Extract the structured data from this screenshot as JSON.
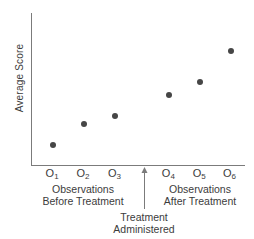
{
  "figure": {
    "y_axis_label": "Average Score",
    "annotations": {
      "before": [
        "Observations",
        "Before Treatment"
      ],
      "after": [
        "Observations",
        "After Treatment"
      ],
      "treatment": [
        "Treatment",
        "Administered"
      ]
    }
  },
  "colors": {
    "axis": "#7b7b7b",
    "dot": "#464646",
    "text": "#3c3c3c",
    "background": "#ffffff"
  },
  "chart_data": {
    "type": "scatter",
    "title": "",
    "xlabel": "",
    "ylabel": "Average Score",
    "categories": [
      "O1",
      "O2",
      "O3",
      "O4",
      "O5",
      "O6"
    ],
    "values": [
      20,
      41,
      49,
      70,
      83,
      114
    ],
    "ylim": [
      0,
      152
    ],
    "grid": false,
    "y_axis_numeric_labels": false,
    "points": [
      {
        "label": "O1",
        "x_frac": 0.099,
        "value": 20
      },
      {
        "label": "O2",
        "x_frac": 0.244,
        "value": 41
      },
      {
        "label": "O3",
        "x_frac": 0.392,
        "value": 49
      },
      {
        "label": "O4",
        "x_frac": 0.645,
        "value": 70
      },
      {
        "label": "O5",
        "x_frac": 0.79,
        "value": 83
      },
      {
        "label": "O6",
        "x_frac": 0.932,
        "value": 114
      }
    ],
    "treatment_arrow_x_frac": 0.531,
    "x_groups": {
      "before_treatment": [
        "O1",
        "O2",
        "O3"
      ],
      "after_treatment": [
        "O4",
        "O5",
        "O6"
      ]
    }
  }
}
